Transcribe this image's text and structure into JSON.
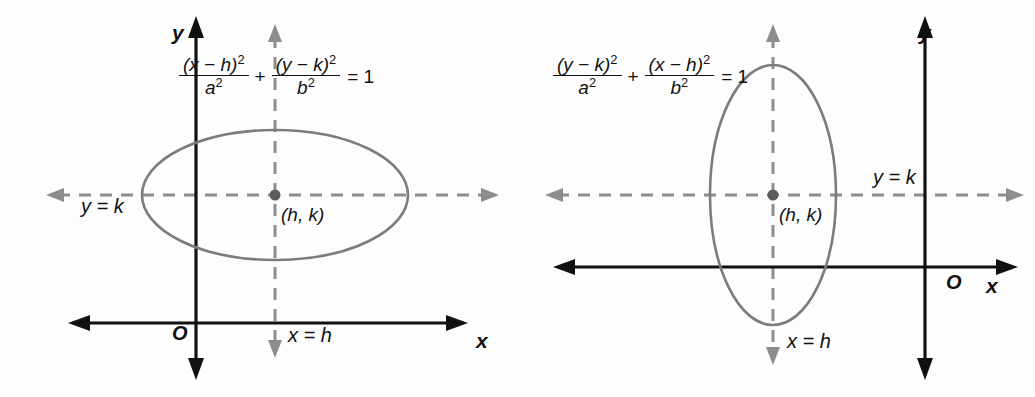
{
  "figure": {
    "colors": {
      "axis": "#111111",
      "guide": "#8d8d8d",
      "curve": "#7c7c7c",
      "background": "#fdfdfd"
    }
  },
  "panels": [
    {
      "id": "horizontal-ellipse",
      "orientation": "horizontal",
      "equation": {
        "text": "(x - h)^2/a^2 + (y - k)^2/b^2 = 1",
        "first_numerator_var": "x",
        "first_numerator_const": "h",
        "first_denominator": "a",
        "second_numerator_var": "y",
        "second_numerator_const": "k",
        "second_denominator": "b",
        "operator": "+",
        "equals": "= 1",
        "exponent": "2"
      },
      "axis_labels": {
        "y": "y",
        "x": "x",
        "origin": "O"
      },
      "guide_labels": {
        "horizontal": "y = k",
        "vertical": "x = h"
      },
      "center_label": "(h, k)",
      "geometry": {
        "center_x": 275,
        "center_y": 195,
        "radius_x": 133,
        "radius_y": 65,
        "y_axis_x": 196,
        "x_axis_y": 323
      }
    },
    {
      "id": "vertical-ellipse",
      "orientation": "vertical",
      "equation": {
        "text": "(y - k)^2/a^2 + (x - h)^2/b^2 = 1",
        "first_numerator_var": "y",
        "first_numerator_const": "k",
        "first_denominator": "a",
        "second_numerator_var": "x",
        "second_numerator_const": "h",
        "second_denominator": "b",
        "operator": "+",
        "equals": "= 1",
        "exponent": "2"
      },
      "axis_labels": {
        "y": "y",
        "x": "x",
        "origin": "O"
      },
      "guide_labels": {
        "horizontal": "y = k",
        "vertical": "x = h"
      },
      "center_label": "(h, k)",
      "geometry": {
        "center_x": 773,
        "center_y": 195,
        "radius_x": 63,
        "radius_y": 130,
        "y_axis_x": 925,
        "x_axis_y": 267
      }
    }
  ]
}
